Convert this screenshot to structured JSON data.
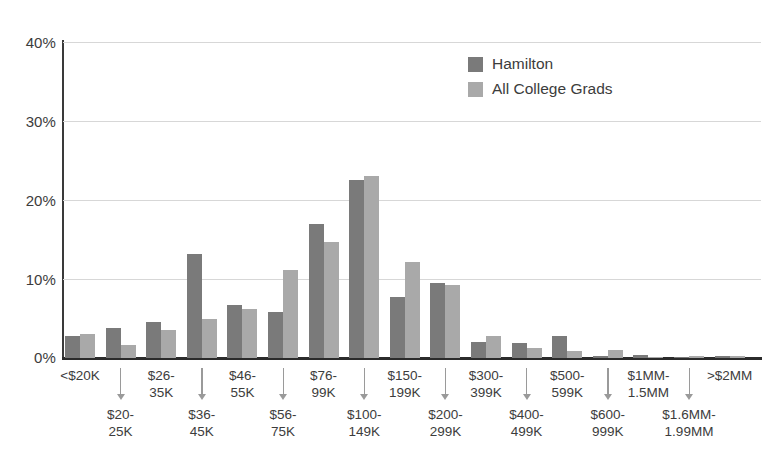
{
  "chart_data": {
    "type": "bar",
    "title": "",
    "subtitle": "",
    "xlabel": "",
    "ylabel": "",
    "ylim": [
      0,
      40
    ],
    "yticks": [
      0,
      10,
      20,
      30,
      40
    ],
    "ytick_labels": [
      "0%",
      "10%",
      "20%",
      "30%",
      "40%"
    ],
    "grid": "horizontal",
    "legend_position": "top-right",
    "categories": [
      "<$20K",
      "$20-25K",
      "$26-35K",
      "$36-45K",
      "$46-55K",
      "$56-75K",
      "$76-99K",
      "$100-149K",
      "$150-199K",
      "$200-299K",
      "$300-399K",
      "$400-499K",
      "$500-599K",
      "$600-999K",
      "$1MM-1.5MM",
      "$1.6MM-1.99MM",
      ">$2MM"
    ],
    "series": [
      {
        "name": "Hamilton",
        "color": "#7a7a7a",
        "values": [
          2.8,
          3.8,
          4.6,
          13.2,
          6.7,
          5.8,
          17.0,
          22.5,
          7.7,
          9.5,
          2.0,
          1.9,
          2.8,
          0.2,
          0.4,
          0.1,
          0.2
        ]
      },
      {
        "name": "All College Grads",
        "color": "#a9a9a9",
        "values": [
          3.0,
          1.7,
          3.6,
          5.0,
          6.2,
          11.2,
          14.7,
          23.0,
          12.2,
          9.3,
          2.8,
          1.3,
          0.9,
          1.0,
          0.1,
          0.3,
          0.2
        ]
      }
    ]
  },
  "legend": {
    "items": [
      {
        "label": "Hamilton",
        "color": "#7a7a7a"
      },
      {
        "label": "All College Grads",
        "color": "#a9a9a9"
      }
    ]
  },
  "axis": {
    "y_labels": [
      "40%",
      "30%",
      "20%",
      "10%",
      "0%"
    ]
  },
  "xaxis": {
    "top_row": [
      "<$20K",
      "$26-\n35K",
      "$46-\n55K",
      "$76-\n99K",
      "$150-\n199K",
      "$300-\n399K",
      "$500-\n599K",
      "$1MM-\n1.5MM",
      ">$2MM"
    ],
    "bottom_row": [
      "$20-\n25K",
      "$36-\n45K",
      "$56-\n75K",
      "$100-\n149K",
      "$200-\n299K",
      "$400-\n499K",
      "$600-\n999K",
      "$1.6MM-\n1.99MM"
    ]
  },
  "colors": {
    "series_dark": "#7a7a7a",
    "series_light": "#a9a9a9",
    "grid": "#d7d7d7",
    "axis": "#2b2b2b",
    "text": "#3c3c3c",
    "background": "#ffffff"
  }
}
